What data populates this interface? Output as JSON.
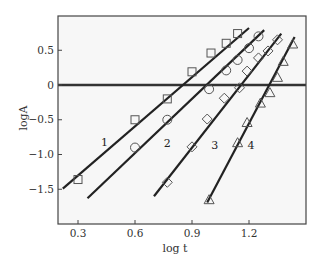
{
  "chart_data": {
    "type": "scatter",
    "title": "",
    "xlabel": "log t",
    "ylabel": "logA",
    "xlim": [
      0.2,
      1.5
    ],
    "ylim": [
      -1.99,
      0.98
    ],
    "x_ticks": [
      0.3,
      0.6,
      0.9,
      1.2
    ],
    "x_tick_labels": [
      "0.3",
      "0.6",
      "0.9",
      "1.2"
    ],
    "y_ticks": [
      0.5,
      0,
      -0.5,
      -1.0,
      -1.5
    ],
    "y_tick_labels": [
      "0.5",
      "0",
      "-0.5",
      "-1.0",
      "-1.5"
    ],
    "grid": false,
    "legend": "none (series labelled inline 1-4)",
    "reference_line": {
      "y": 0,
      "style": "thick horizontal"
    },
    "series": [
      {
        "name": "1",
        "marker": "square",
        "points": [
          [
            0.3,
            -1.36
          ],
          [
            0.6,
            -0.5
          ],
          [
            0.77,
            -0.2
          ],
          [
            0.9,
            0.19
          ],
          [
            1.0,
            0.46
          ],
          [
            1.08,
            0.6
          ],
          [
            1.14,
            0.74
          ]
        ],
        "fit_line": [
          [
            0.22,
            -1.49
          ],
          [
            1.2,
            0.82
          ]
        ],
        "label_pos": [
          0.44,
          -0.82
        ]
      },
      {
        "name": "2",
        "marker": "circle",
        "points": [
          [
            0.6,
            -0.9
          ],
          [
            0.77,
            -0.5
          ],
          [
            0.99,
            -0.06
          ],
          [
            1.08,
            0.21
          ],
          [
            1.14,
            0.36
          ],
          [
            1.2,
            0.53
          ],
          [
            1.25,
            0.7
          ]
        ],
        "fit_line": [
          [
            0.35,
            -1.63
          ],
          [
            1.28,
            0.79
          ]
        ],
        "label_pos": [
          0.77,
          -0.84
        ]
      },
      {
        "name": "3",
        "marker": "diamond",
        "points": [
          [
            0.77,
            -1.4
          ],
          [
            0.9,
            -0.89
          ],
          [
            0.98,
            -0.49
          ],
          [
            1.07,
            -0.19
          ],
          [
            1.15,
            -0.04
          ],
          [
            1.19,
            0.2
          ],
          [
            1.25,
            0.39
          ],
          [
            1.3,
            0.49
          ],
          [
            1.35,
            0.65
          ]
        ],
        "fit_line": [
          [
            0.7,
            -1.6
          ],
          [
            1.37,
            0.74
          ]
        ],
        "label_pos": [
          1.02,
          -0.86
        ]
      },
      {
        "name": "4",
        "marker": "triangle",
        "points": [
          [
            0.99,
            -1.65
          ],
          [
            1.14,
            -0.83
          ],
          [
            1.19,
            -0.54
          ],
          [
            1.26,
            -0.26
          ],
          [
            1.31,
            -0.11
          ],
          [
            1.35,
            0.11
          ],
          [
            1.38,
            0.34
          ],
          [
            1.43,
            0.59
          ]
        ],
        "fit_line": [
          [
            0.98,
            -1.69
          ],
          [
            1.44,
            0.69
          ]
        ],
        "label_pos": [
          1.21,
          -0.86
        ]
      }
    ]
  }
}
